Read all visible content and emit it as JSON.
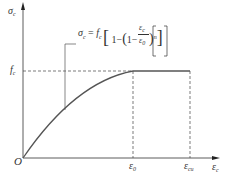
{
  "diagram": {
    "y_axis_label": {
      "main": "σ",
      "sub": "c"
    },
    "x_axis_label": {
      "main": "ε",
      "sub": "c"
    },
    "origin_label": "O",
    "fc_label": {
      "main": "f",
      "sub": "c"
    },
    "eps0_label": {
      "main": "ε",
      "sub": "0"
    },
    "epscu_label": {
      "main": "ε",
      "sub": "cu"
    },
    "equation": "σc = fc [ 1 − ( 1 − εc / ε0 )^n ]",
    "equation_parts": {
      "lhs": "σ",
      "lhs_sub": "c",
      "eq": " = ",
      "f": "f",
      "f_sub": "c",
      "one": "1−",
      "one2": "1−",
      "num": "ε",
      "num_sub": "c",
      "den": "ε",
      "den_sub": "0",
      "exp": "n"
    }
  },
  "colors": {
    "axis": "#333333",
    "curve": "#555555",
    "dashed": "#444444"
  }
}
